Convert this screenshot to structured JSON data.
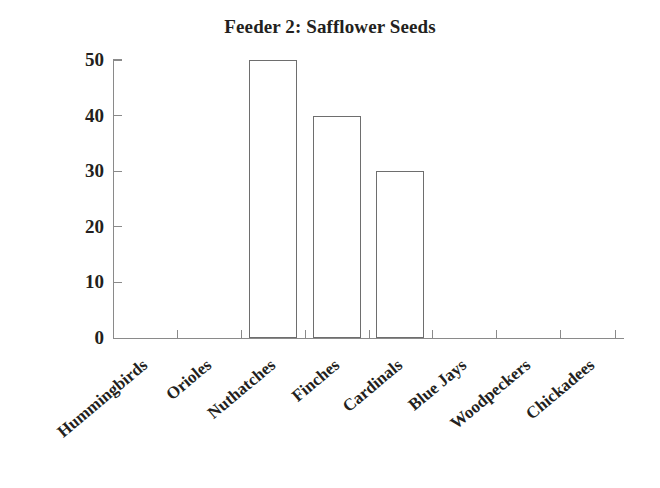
{
  "chart_data": {
    "type": "bar",
    "title": "Feeder 2: Safflower Seeds",
    "xlabel": "",
    "ylabel": "",
    "categories": [
      "Hummingbirds",
      "Orioles",
      "Nuthatches",
      "Finches",
      "Cardinals",
      "Blue Jays",
      "Woodpeckers",
      "Chickadees"
    ],
    "values": [
      0,
      0,
      50,
      40,
      30,
      0,
      0,
      0
    ],
    "ylim": [
      0,
      50
    ],
    "yticks": [
      0,
      10,
      20,
      30,
      40,
      50
    ],
    "ytick_labels": [
      "0",
      "10",
      "20",
      "30",
      "40",
      "50"
    ],
    "grid": false,
    "legend": false,
    "bar_fill": "#ffffff",
    "bar_edge": "#6e6e6e",
    "axis_color": "#8a8a8a",
    "text_color": "#231f20"
  }
}
